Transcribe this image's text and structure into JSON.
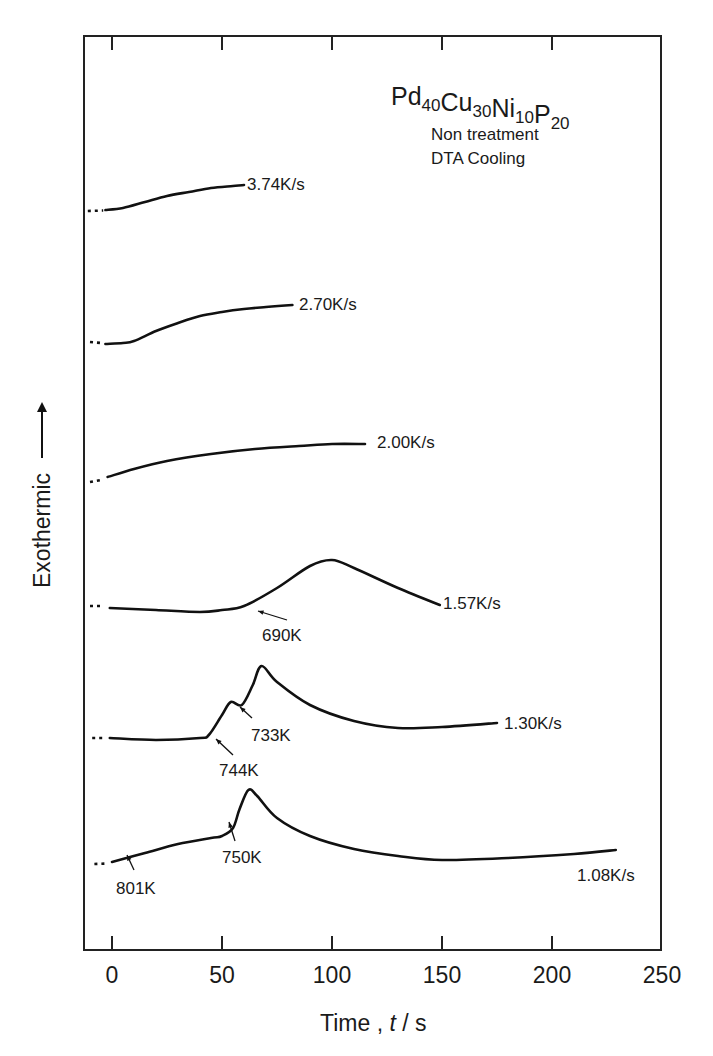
{
  "chart_data": {
    "type": "line",
    "title": "Pd40Cu30Ni10P20",
    "composition": [
      {
        "el": "Pd",
        "sub": "40"
      },
      {
        "el": "Cu",
        "sub": "30"
      },
      {
        "el": "Ni",
        "sub": "10"
      },
      {
        "el": "P",
        "sub": "20"
      }
    ],
    "notes": [
      "Non treatment",
      "DTA Cooling"
    ],
    "xlabel": "Time , t / s",
    "xlabel_parts": {
      "pre": "Time , ",
      "var": "t",
      "post": " / s"
    },
    "ylabel": "Exothermic",
    "ylabel_arrow": "up",
    "xlim": [
      -12,
      250
    ],
    "xticks": [
      0,
      50,
      100,
      150,
      200,
      250
    ],
    "xtick_labels": [
      "0",
      "50",
      "100",
      "150",
      "200",
      "250"
    ],
    "grid": false,
    "y_units": "arbitrary (relative exothermic signal, curves vertically offset)",
    "series": [
      {
        "name": "3.74K/s",
        "label": "3.74K/s",
        "dashed_prefix": [
          [
            -11,
            0
          ],
          [
            -4,
            0.5
          ]
        ],
        "x": [
          -3,
          5,
          15,
          25,
          35,
          45,
          55,
          60
        ],
        "y": [
          1,
          3,
          9,
          15,
          19,
          23,
          25,
          26
        ]
      },
      {
        "name": "2.70K/s",
        "label": "2.70K/s",
        "dashed_prefix": [
          [
            -10,
            2
          ],
          [
            -5,
            1
          ]
        ],
        "x": [
          -3,
          5,
          10,
          20,
          30,
          40,
          50,
          60,
          70,
          82
        ],
        "y": [
          0,
          1,
          3,
          13,
          21,
          28,
          32,
          35,
          37,
          39
        ]
      },
      {
        "name": "2.00K/s",
        "label": "2.00K/s",
        "dashed_prefix": [
          [
            -10,
            0
          ],
          [
            -5,
            2
          ]
        ],
        "x": [
          -2,
          10,
          25,
          45,
          65,
          85,
          100,
          115
        ],
        "y": [
          5,
          13,
          21,
          28,
          33,
          36,
          38,
          38
        ]
      },
      {
        "name": "1.57K/s",
        "label": "1.57K/s",
        "dashed_prefix": [
          [
            -10,
            6
          ],
          [
            -5,
            6
          ]
        ],
        "x": [
          -1,
          20,
          40,
          50,
          60,
          75,
          90,
          100,
          110,
          130,
          149
        ],
        "y": [
          4,
          2,
          0,
          2,
          6,
          24,
          46,
          52,
          44,
          24,
          7
        ],
        "annotations": [
          {
            "text": "690K",
            "x": 64,
            "note": "onset"
          }
        ]
      },
      {
        "name": "1.30K/s",
        "label": "1.30K/s",
        "dashed_prefix": [
          [
            -9,
            2
          ],
          [
            -3,
            2
          ]
        ],
        "x": [
          -1,
          20,
          40,
          44,
          50,
          54,
          59,
          64,
          68,
          75,
          90,
          110,
          130,
          150,
          175
        ],
        "y": [
          2,
          0,
          2,
          5,
          25,
          38,
          35,
          55,
          74,
          58,
          35,
          19,
          12,
          13,
          17
        ],
        "annotations": [
          {
            "text": "744K",
            "x": 47,
            "note": "first onset"
          },
          {
            "text": "733K",
            "x": 58,
            "note": "second onset"
          }
        ]
      },
      {
        "name": "1.08K/s",
        "label": "1.08K/s",
        "dashed_prefix": [
          [
            -8,
            0
          ],
          [
            -2,
            0.5
          ]
        ],
        "x": [
          0,
          15,
          30,
          45,
          50,
          55,
          58,
          62,
          66,
          75,
          90,
          110,
          130,
          150,
          180,
          210,
          229
        ],
        "y": [
          2,
          11,
          20,
          26,
          28,
          36,
          55,
          74,
          68,
          46,
          28,
          15,
          8,
          4,
          6,
          10,
          14
        ],
        "annotations": [
          {
            "text": "801K",
            "x": 7,
            "note": "start"
          },
          {
            "text": "750K",
            "x": 54,
            "note": "onset"
          }
        ]
      }
    ]
  },
  "layout": {
    "plot": {
      "left": 84,
      "top": 36,
      "right": 661,
      "bottom": 950
    },
    "x0_px": 112,
    "px_per_s": 2.2,
    "baselines_px": [
      211,
      344,
      482,
      612,
      740,
      864
    ]
  }
}
